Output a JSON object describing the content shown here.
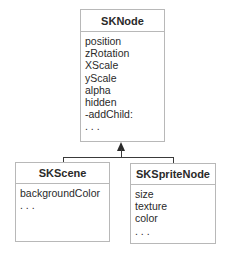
{
  "classes": {
    "parent": {
      "name": "SKNode",
      "members": [
        "position",
        "zRotation",
        "XScale",
        "yScale",
        "alpha",
        "hidden",
        "-addChild:",
        ". . ."
      ]
    },
    "left_child": {
      "name": "SKScene",
      "members": [
        "backgroundColor",
        ". . ."
      ]
    },
    "right_child": {
      "name": "SKSpriteNode",
      "members": [
        "size",
        "texture",
        "color",
        ". . ."
      ]
    }
  },
  "relationship": {
    "type": "inheritance",
    "arrow": "arrow-up-icon"
  }
}
